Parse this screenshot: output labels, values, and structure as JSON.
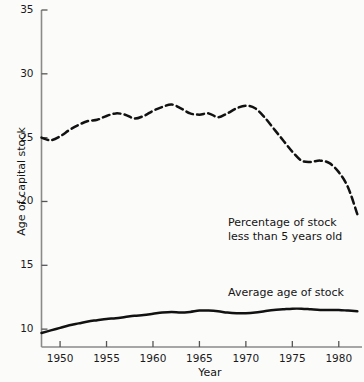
{
  "chart_data": {
    "type": "line",
    "title": "",
    "xlabel": "Year",
    "ylabel": "Age of capital stock",
    "xlim": [
      1948,
      1982.5
    ],
    "ylim": [
      8.6,
      35
    ],
    "grid": false,
    "legend_position": "inline-annotation",
    "x_ticks": [
      1950,
      1955,
      1960,
      1965,
      1970,
      1975,
      1980
    ],
    "x_tick_labels": [
      "1950",
      "1955",
      "1960",
      "1965",
      "1970",
      "1975",
      "1980"
    ],
    "y_ticks": [
      10,
      15,
      20,
      25,
      30,
      35
    ],
    "y_tick_labels": [
      "10",
      "15",
      "20",
      "25",
      "30",
      "35"
    ],
    "series": [
      {
        "name": "Percentage of stock less than 5 years old",
        "style": "dashed",
        "color": "#111111",
        "annotation_lines": [
          "Percentage of stock",
          "less than 5 years old"
        ],
        "x": [
          1948,
          1949,
          1950,
          1951,
          1952,
          1953,
          1954,
          1955,
          1956,
          1957,
          1958,
          1959,
          1960,
          1961,
          1962,
          1963,
          1964,
          1965,
          1966,
          1967,
          1968,
          1969,
          1970,
          1971,
          1972,
          1973,
          1974,
          1975,
          1976,
          1977,
          1978,
          1979,
          1980,
          1981,
          1982
        ],
        "values": [
          25.0,
          24.8,
          25.1,
          25.6,
          26.0,
          26.3,
          26.4,
          26.7,
          26.9,
          26.8,
          26.5,
          26.7,
          27.1,
          27.4,
          27.6,
          27.3,
          26.9,
          26.8,
          26.9,
          26.6,
          26.9,
          27.3,
          27.5,
          27.3,
          26.6,
          25.7,
          24.8,
          23.9,
          23.2,
          23.1,
          23.2,
          23.0,
          22.3,
          21.1,
          19.0
        ]
      },
      {
        "name": "Average age of stock",
        "style": "solid",
        "color": "#111111",
        "annotation_lines": [
          "Average age of stock"
        ],
        "x": [
          1948,
          1949,
          1950,
          1951,
          1952,
          1953,
          1954,
          1955,
          1956,
          1957,
          1958,
          1959,
          1960,
          1961,
          1962,
          1963,
          1964,
          1965,
          1966,
          1967,
          1968,
          1969,
          1970,
          1971,
          1972,
          1973,
          1974,
          1975,
          1976,
          1977,
          1978,
          1979,
          1980,
          1981,
          1982
        ],
        "values": [
          9.7,
          9.9,
          10.1,
          10.3,
          10.45,
          10.6,
          10.7,
          10.8,
          10.85,
          10.95,
          11.05,
          11.1,
          11.2,
          11.3,
          11.35,
          11.3,
          11.35,
          11.45,
          11.45,
          11.4,
          11.3,
          11.25,
          11.25,
          11.3,
          11.4,
          11.5,
          11.55,
          11.6,
          11.6,
          11.55,
          11.5,
          11.5,
          11.5,
          11.45,
          11.4
        ]
      }
    ]
  },
  "axes": {
    "y_title": "Age of capital stock",
    "x_title": "Year"
  }
}
